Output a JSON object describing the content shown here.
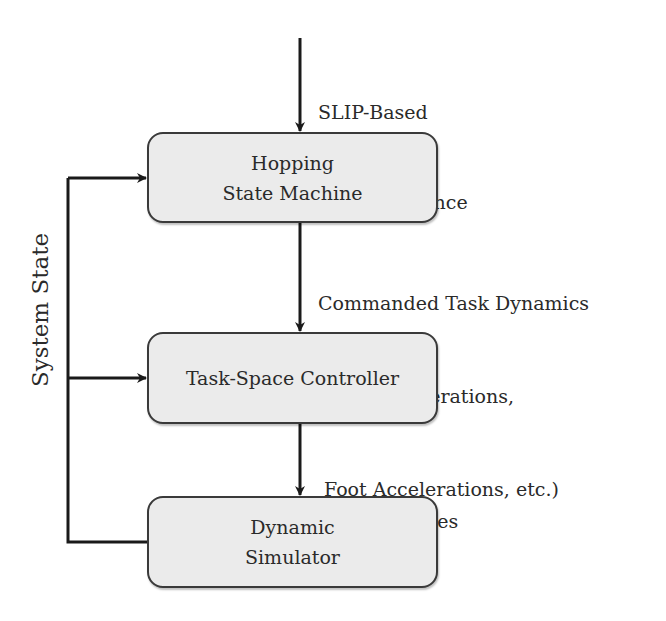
{
  "diagram": {
    "type": "block-diagram",
    "colors": {
      "box_fill": "#ebebeb",
      "box_border": "#3a3a3a",
      "arrow": "#1a1a1a",
      "text": "#2a2a2a"
    },
    "input": {
      "lines": [
        "SLIP-Based",
        "CoM Reference"
      ]
    },
    "blocks": [
      {
        "id": "hopping-state-machine",
        "lines": [
          "Hopping",
          "State Machine"
        ]
      },
      {
        "id": "task-space-controller",
        "lines": [
          "Task-Space Controller"
        ]
      },
      {
        "id": "dynamic-simulator",
        "lines": [
          "Dynamic",
          "Simulator"
        ]
      }
    ],
    "edges": [
      {
        "from": "input",
        "to": "hopping-state-machine",
        "lines": [
          "SLIP-Based",
          "CoM Reference"
        ]
      },
      {
        "from": "hopping-state-machine",
        "to": "task-space-controller",
        "lines": [
          "Commanded Task Dynamics",
          "(CoM Accelerations,",
          " Foot Accelerations, etc.)"
        ]
      },
      {
        "from": "task-space-controller",
        "to": "dynamic-simulator",
        "lines": [
          "Joint Torques"
        ]
      },
      {
        "from": "dynamic-simulator",
        "to": [
          "hopping-state-machine",
          "task-space-controller"
        ],
        "label": "System State"
      }
    ],
    "feedback_label": "System State"
  }
}
